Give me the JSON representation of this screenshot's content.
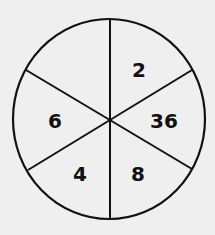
{
  "diagram": {
    "type": "number-circle-puzzle",
    "background": "#efefef",
    "stroke_color": "#111111",
    "circle": {
      "cx": 109,
      "cy": 119,
      "rx": 96,
      "ry": 100
    },
    "center": {
      "x": 110,
      "y": 120
    },
    "divider_lines": [
      {
        "x1": 110,
        "y1": 18,
        "x2": 110,
        "y2": 219
      },
      {
        "x1": 26,
        "y1": 70,
        "x2": 192,
        "y2": 169
      },
      {
        "x1": 28,
        "y1": 170,
        "x2": 192,
        "y2": 70
      }
    ],
    "sectors": [
      {
        "position": "top-right",
        "value": "2",
        "x": 139,
        "y": 70
      },
      {
        "position": "right",
        "value": "36",
        "x": 164,
        "y": 121
      },
      {
        "position": "bottom-right",
        "value": "8",
        "x": 138,
        "y": 174
      },
      {
        "position": "bottom-left",
        "value": "4",
        "x": 80,
        "y": 174
      },
      {
        "position": "left",
        "value": "6",
        "x": 55,
        "y": 121
      },
      {
        "position": "top-left",
        "value": "",
        "x": 75,
        "y": 70
      }
    ]
  }
}
